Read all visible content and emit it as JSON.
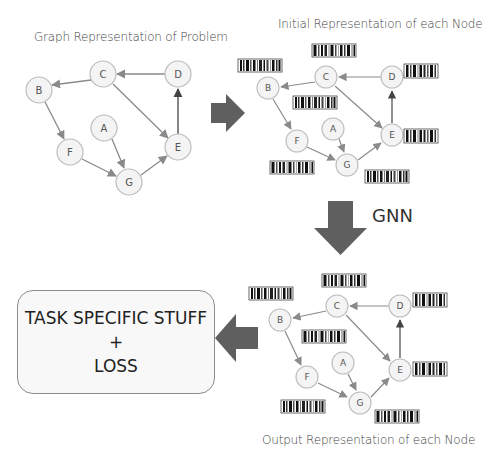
{
  "colors": {
    "background": "#ffffff",
    "node_fill": "#f4f4f4",
    "node_stroke": "#bdbdbd",
    "edge": "#8a8a8a",
    "edge_up": "#444444",
    "big_arrow": "#5f5f5f",
    "task_box_fill": "#f8f8f8",
    "task_box_stroke": "#8c8c8c"
  },
  "panels": {
    "input_graph": {
      "title": "Graph Representation of Problem",
      "nodes": [
        {
          "id": "A",
          "label": "A"
        },
        {
          "id": "B",
          "label": "B"
        },
        {
          "id": "C",
          "label": "C"
        },
        {
          "id": "D",
          "label": "D"
        },
        {
          "id": "E",
          "label": "E"
        },
        {
          "id": "F",
          "label": "F"
        },
        {
          "id": "G",
          "label": "G"
        }
      ],
      "edges": [
        {
          "from": "D",
          "to": "C"
        },
        {
          "from": "C",
          "to": "B"
        },
        {
          "from": "C",
          "to": "E"
        },
        {
          "from": "B",
          "to": "F"
        },
        {
          "from": "F",
          "to": "G"
        },
        {
          "from": "A",
          "to": "G"
        },
        {
          "from": "G",
          "to": "E"
        },
        {
          "from": "E",
          "to": "D"
        }
      ]
    },
    "initial_representation": {
      "title": "Initial Representation of each Node"
    },
    "output_representation": {
      "title": "Output Representation of each Node"
    }
  },
  "arrows": {
    "right_arrow": {
      "direction": "right"
    },
    "down_arrow": {
      "direction": "down",
      "label": "GNN"
    },
    "left_arrow": {
      "direction": "left"
    }
  },
  "task_box": {
    "line1": "TASK SPECIFIC STUFF",
    "line2": "+",
    "line3": "LOSS"
  },
  "node_labels": {
    "A": "A",
    "B": "B",
    "C": "C",
    "D": "D",
    "E": "E",
    "F": "F",
    "G": "G"
  }
}
